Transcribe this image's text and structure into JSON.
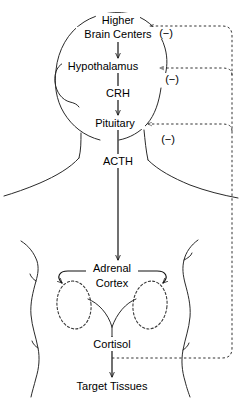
{
  "diagram": {
    "background_color": "#ffffff",
    "line_color": "#2a2a2a",
    "arrow_color": "#111111",
    "feedback_color": "#333333",
    "nodes": [
      {
        "id": "higher-brain-centers",
        "label_line1": "Higher",
        "label_line2": "Brain Centers",
        "x": 118,
        "y1": 22,
        "y2": 36
      },
      {
        "id": "hypothalamus",
        "label": "Hypothalamus",
        "x": 118,
        "y": 68
      },
      {
        "id": "crh",
        "label": "CRH",
        "x": 118,
        "y": 95
      },
      {
        "id": "pituitary",
        "label": "Pituitary",
        "x": 118,
        "y": 125
      },
      {
        "id": "acth",
        "label": "ACTH",
        "x": 118,
        "y": 163
      },
      {
        "id": "adrenal-cortex",
        "label_line1": "Adrenal",
        "label_line2": "Cortex",
        "x": 112,
        "y1": 270,
        "y2": 285
      },
      {
        "id": "cortisol",
        "label": "Cortisol",
        "x": 112,
        "y": 346
      },
      {
        "id": "target-tissues",
        "label": "Target Tissues",
        "x": 112,
        "y": 388
      }
    ],
    "feedback_labels": [
      {
        "id": "feedback-sign-brain",
        "label": "(−)",
        "x": 166,
        "y": 36,
        "target": "higher-brain-centers"
      },
      {
        "id": "feedback-sign-hypothalamus",
        "label": "(−)",
        "x": 172,
        "y": 82,
        "target": "hypothalamus"
      },
      {
        "id": "feedback-sign-pituitary",
        "label": "(−)",
        "x": 168,
        "y": 142,
        "target": "pituitary"
      }
    ],
    "organs": [
      {
        "id": "left-kidney",
        "shape": "dashed-ellipse",
        "cx": 74,
        "cy": 305,
        "rx": 17,
        "ry": 24
      },
      {
        "id": "right-kidney",
        "shape": "dashed-ellipse",
        "cx": 150,
        "cy": 305,
        "rx": 17,
        "ry": 24
      }
    ],
    "flow_chain": [
      "Higher Brain Centers",
      "Hypothalamus",
      "CRH",
      "Pituitary",
      "ACTH",
      "Adrenal Cortex",
      "Cortisol",
      "Target Tissues"
    ],
    "feedback_description": "Cortisol exerts negative feedback on pituitary, hypothalamus and higher brain centers."
  }
}
